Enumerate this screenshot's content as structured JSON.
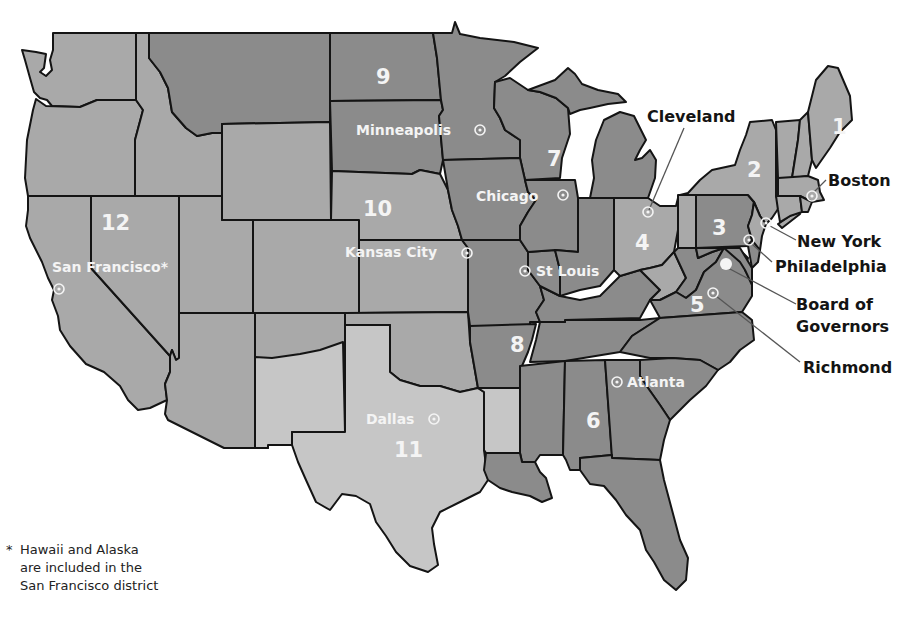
{
  "map": {
    "title": "Federal Reserve Districts",
    "colors": {
      "light": "#a9a9a9",
      "dark": "#8b8b8b",
      "lightest": "#c6c6c6",
      "border": "#141414",
      "label_on_map": "#f4f4f4",
      "label_off_map": "#141414"
    },
    "districts": [
      {
        "number": "1",
        "city": "Boston",
        "shade": "light"
      },
      {
        "number": "2",
        "city": "New York",
        "shade": "light"
      },
      {
        "number": "3",
        "city": "Philadelphia",
        "shade": "dark"
      },
      {
        "number": "4",
        "city": "Cleveland",
        "shade": "light"
      },
      {
        "number": "5",
        "city": "Richmond",
        "shade": "dark"
      },
      {
        "number": "6",
        "city": "Atlanta",
        "shade": "dark"
      },
      {
        "number": "7",
        "city": "Chicago",
        "shade": "dark"
      },
      {
        "number": "8",
        "city": "St Louis",
        "shade": "dark"
      },
      {
        "number": "9",
        "city": "Minneapolis",
        "shade": "dark"
      },
      {
        "number": "10",
        "city": "Kansas City",
        "shade": "light"
      },
      {
        "number": "11",
        "city": "Dallas",
        "shade": "lightest"
      },
      {
        "number": "12",
        "city": "San Francisco*",
        "shade": "light"
      }
    ],
    "callouts": {
      "cleveland": "Cleveland",
      "boston": "Boston",
      "new_york": "New York",
      "philadelphia": "Philadelphia",
      "board_line1": "Board of",
      "board_line2": "Governors",
      "richmond": "Richmond"
    },
    "inline_labels": {
      "minneapolis": "Minneapolis",
      "chicago": "Chicago",
      "kansas_city": "Kansas City",
      "st_louis": "St Louis",
      "san_francisco": "San Francisco*",
      "atlanta": "Atlanta",
      "dallas": "Dallas"
    },
    "legend": {
      "reserve_bank_marker": "circle-dot-icon",
      "board_marker": "filled-circle-icon"
    }
  },
  "footnote": {
    "star": "*",
    "line1": "Hawaii and Alaska",
    "line2": "are included in the",
    "line3": "San Francisco district"
  }
}
